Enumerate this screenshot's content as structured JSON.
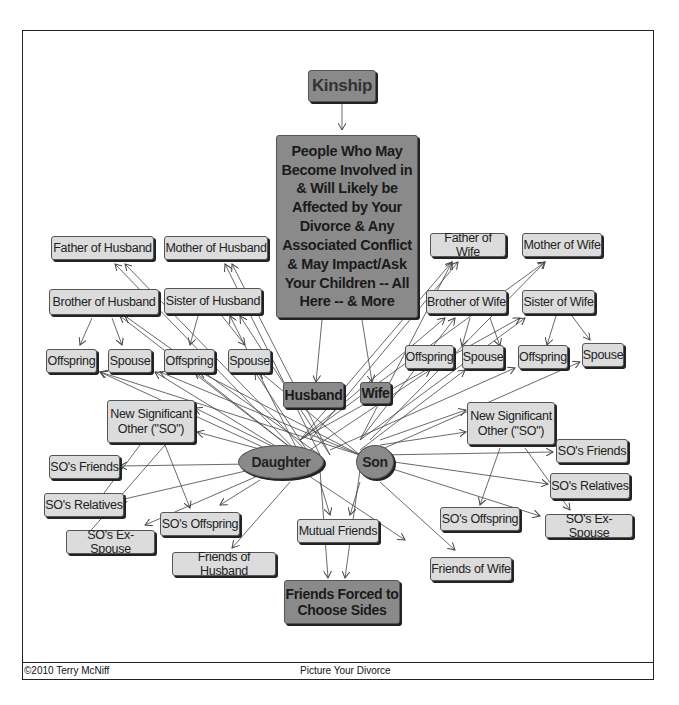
{
  "title": "Kinship",
  "main_box": "People Who May Become Involved in & Will Likely be Affected by Your Divorce & Any Associated Conflict & May Impact/Ask Your Children -- All Here -- & More",
  "nodes": {
    "father_husband": "Father of Husband",
    "mother_husband": "Mother of Husband",
    "brother_husband": "Brother of Husband",
    "sister_husband": "Sister of Husband",
    "offspring_bh": "Offspring",
    "spouse_bh": "Spouse",
    "offspring_sh": "Offspring",
    "spouse_sh": "Spouse",
    "father_wife": "Father of Wife",
    "mother_wife": "Mother of Wife",
    "brother_wife": "Brother of Wife",
    "sister_wife": "Sister of Wife",
    "offspring_bw": "Offspring",
    "spouse_bw": "Spouse",
    "offspring_sw": "Offspring",
    "spouse_sw": "Spouse",
    "husband": "Husband",
    "wife": "Wife",
    "daughter": "Daughter",
    "son": "Son",
    "so_left": "New Significant Other (\"SO\")",
    "so_friends_left": "SO's Friends",
    "so_relatives_left": "SO's Relatives",
    "so_exspouse_left": "SO's Ex-Spouse",
    "so_offspring_left": "SO's Offspring",
    "so_right": "New Significant Other (\"SO\")",
    "so_friends_right": "SO's Friends",
    "so_relatives_right": "SO's Relatives",
    "so_exspouse_right": "SO's Ex-Spouse",
    "so_offspring_right": "SO's Offspring",
    "friends_husband": "Friends of Husband",
    "mutual_friends": "Mutual Friends",
    "friends_wife": "Friends of Wife",
    "friends_forced": "Friends Forced to Choose Sides"
  },
  "footer": {
    "copyright": "©2010 Terry McNiff",
    "center": "Picture Your Divorce"
  },
  "colors": {
    "dark_box": "#8a8a8a",
    "light_box": "#dcdcdc",
    "edge": "#444444"
  }
}
